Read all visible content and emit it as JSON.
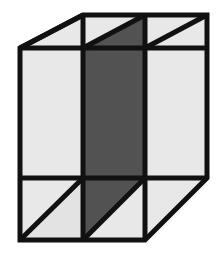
{
  "figure": {
    "type": "line-drawing",
    "canvas": {
      "width": 224,
      "height": 257,
      "background": "#ffffff"
    },
    "colors": {
      "background": "#ffffff",
      "light_face": "#e8e8e8",
      "light_face_alt": "#e3e3e3",
      "dark_face": "#525252",
      "dark_face_alt": "#4d4d4d",
      "stroke": "#111111"
    },
    "stroke": {
      "width": 5,
      "linejoin": "miter",
      "linecap": "butt"
    },
    "vertices": {
      "front_top_left": [
        83,
        48
      ],
      "front_top_right": [
        145,
        48
      ],
      "front_bottom_right": [
        145,
        178
      ],
      "front_bottom_left": [
        83,
        178
      ],
      "back_top_left": [
        20,
        48
      ],
      "back_top_right": [
        207,
        15
      ],
      "outer_top_left": [
        83,
        15
      ],
      "outer_bottom_left": [
        20,
        240
      ],
      "outer_bottom_right": [
        145,
        240
      ],
      "right_bottom": [
        207,
        178
      ],
      "left_upper": [
        20,
        48
      ],
      "top_edge_left": [
        83,
        15
      ],
      "top_edge_right": [
        207,
        15
      ]
    },
    "faces": [
      {
        "name": "left-face",
        "shade": "light",
        "fill": "#e8e8e8",
        "points": "20,48 83,48 83,178 20,240"
      },
      {
        "name": "front-face",
        "shade": "dark",
        "fill": "#525252",
        "points": "83,48 145,48 145,178 83,178"
      },
      {
        "name": "right-face",
        "shade": "light",
        "fill": "#e8e8e8",
        "points": "145,48 207,15 207,178 145,178"
      },
      {
        "name": "top-face-left-triangle",
        "shade": "light",
        "fill": "#e8e8e8",
        "points": "20,48 83,15 83,48"
      },
      {
        "name": "top-face-mid-upper-triangle",
        "shade": "light",
        "fill": "#e8e8e8",
        "points": "83,15 145,15 83,48"
      },
      {
        "name": "top-face-mid-lower-triangle",
        "shade": "dark",
        "fill": "#525252",
        "points": "145,15 145,48 83,48"
      },
      {
        "name": "top-face-right-upper-triangle",
        "shade": "light",
        "fill": "#e8e8e8",
        "points": "145,15 207,15 145,48"
      },
      {
        "name": "top-face-right-lower-triangle",
        "shade": "light",
        "fill": "#e3e3e3",
        "points": "207,15 207,48 145,48"
      },
      {
        "name": "bottom-face-left-upper-triangle",
        "shade": "light",
        "fill": "#e8e8e8",
        "points": "20,178 83,178 20,240"
      },
      {
        "name": "bottom-face-left-lower-triangle",
        "shade": "light",
        "fill": "#e3e3e3",
        "points": "83,178 83,240 20,240"
      },
      {
        "name": "bottom-face-mid-upper-triangle",
        "shade": "dark",
        "fill": "#525252",
        "points": "83,178 145,178 83,240"
      },
      {
        "name": "bottom-face-mid-lower-triangle",
        "shade": "light",
        "fill": "#e8e8e8",
        "points": "145,178 145,240 83,240"
      },
      {
        "name": "bottom-face-right-triangle",
        "shade": "light",
        "fill": "#e8e8e8",
        "points": "145,178 207,178 145,240"
      }
    ],
    "edges": [
      {
        "name": "top-edge",
        "from": [
          83,
          15
        ],
        "to": [
          207,
          15
        ]
      },
      {
        "name": "back-left-diagonal-top",
        "from": [
          20,
          48
        ],
        "to": [
          83,
          15
        ]
      },
      {
        "name": "left-vertical-edge",
        "from": [
          20,
          48
        ],
        "to": [
          20,
          240
        ]
      },
      {
        "name": "bottom-edge",
        "from": [
          20,
          240
        ],
        "to": [
          145,
          240
        ]
      },
      {
        "name": "right-vertical-edge",
        "from": [
          207,
          15
        ],
        "to": [
          207,
          178
        ]
      },
      {
        "name": "front-bottom-right-diagonal",
        "from": [
          145,
          240
        ],
        "to": [
          207,
          178
        ]
      },
      {
        "name": "front-left-vertical",
        "from": [
          83,
          15
        ],
        "to": [
          83,
          240
        ]
      },
      {
        "name": "front-right-vertical",
        "from": [
          145,
          15
        ],
        "to": [
          145,
          240
        ]
      },
      {
        "name": "front-top-horizontal",
        "from": [
          20,
          48
        ],
        "to": [
          207,
          48
        ]
      },
      {
        "name": "front-bottom-horizontal",
        "from": [
          20,
          178
        ],
        "to": [
          207,
          178
        ]
      },
      {
        "name": "top-face-diagonal-mid",
        "from": [
          83,
          48
        ],
        "to": [
          145,
          15
        ]
      },
      {
        "name": "top-face-diagonal-right",
        "from": [
          145,
          48
        ],
        "to": [
          207,
          15
        ]
      },
      {
        "name": "bottom-face-diagonal-left",
        "from": [
          20,
          240
        ],
        "to": [
          83,
          178
        ]
      },
      {
        "name": "bottom-face-diagonal-mid",
        "from": [
          83,
          240
        ],
        "to": [
          145,
          178
        ]
      },
      {
        "name": "bottom-face-diagonal-right",
        "from": [
          145,
          240
        ],
        "to": [
          207,
          178
        ]
      }
    ]
  }
}
